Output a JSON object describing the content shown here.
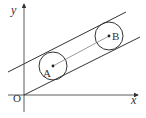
{
  "diagram": {
    "axes": {
      "x_label": "x",
      "y_label": "y",
      "origin_label": "O"
    },
    "circles": [
      {
        "label": "A",
        "center": [
          53,
          67
        ],
        "radius": 14
      },
      {
        "label": "B",
        "center": [
          109,
          36
        ],
        "radius": 14
      }
    ],
    "lines": [
      {
        "name": "lower-tangent",
        "from": [
          24,
          95
        ],
        "to": [
          140,
          37
        ]
      },
      {
        "name": "upper-tangent",
        "from": [
          8,
          72
        ],
        "to": [
          126,
          12
        ]
      }
    ],
    "segment": {
      "from": "A",
      "to": "B"
    },
    "colors": {
      "stroke": "#333333",
      "background": "#ffffff"
    }
  }
}
